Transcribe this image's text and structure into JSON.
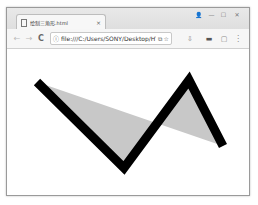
{
  "browser": {
    "tab": {
      "title": "绘制三角形.html",
      "close_glyph": "×"
    },
    "window_controls": {
      "user_glyph": "👤",
      "minimize_glyph": "—",
      "maximize_glyph": "☐",
      "close_glyph": "✕"
    },
    "toolbar": {
      "back_glyph": "←",
      "forward_glyph": "→",
      "reload_glyph": "C",
      "info_glyph": "ⓘ",
      "url": "file:///C:/Users/SONY/Desktop/HTi",
      "translate_glyph": "⧉",
      "star_glyph": "☆",
      "ext1_glyph": "⇩",
      "ext2_glyph": "▬",
      "ext3_glyph": "▢",
      "menu_glyph": "⋮"
    }
  },
  "canvas": {
    "polyline_points": "30,33 117,119 182,31 216,97",
    "stroke_color": "#000000",
    "stroke_width": 9,
    "fill_color": "#c8c8c8"
  }
}
